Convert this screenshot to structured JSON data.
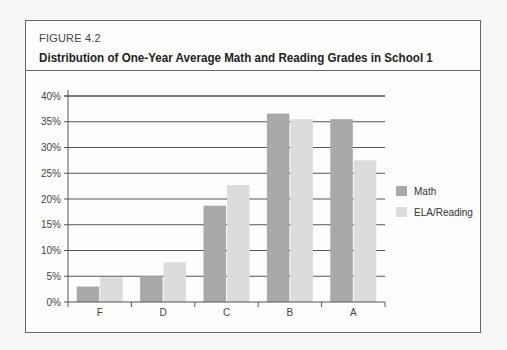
{
  "figure": {
    "label": "FIGURE 4.2",
    "title": "Distribution of One-Year Average Math and Reading Grades in School 1"
  },
  "colors": {
    "math": "#a9a9a9",
    "ela": "#dcdcdc",
    "gridline": "#555555",
    "frame": "#666666"
  },
  "chart_data": {
    "type": "bar",
    "title": "Distribution of One-Year Average Math and Reading Grades in School 1",
    "categories": [
      "F",
      "D",
      "C",
      "B",
      "A"
    ],
    "series": [
      {
        "name": "Math",
        "values": [
          3,
          5,
          18.7,
          36.6,
          35.5
        ]
      },
      {
        "name": "ELA/Reading",
        "values": [
          4.8,
          7.7,
          22.7,
          35.5,
          27.5
        ]
      }
    ],
    "xlabel": "",
    "ylabel": "",
    "ylim": [
      0,
      40
    ],
    "yticks": [
      "0%",
      "5%",
      "10%",
      "15%",
      "20%",
      "25%",
      "30%",
      "35%",
      "40%"
    ],
    "grid": true,
    "legend_position": "right"
  }
}
